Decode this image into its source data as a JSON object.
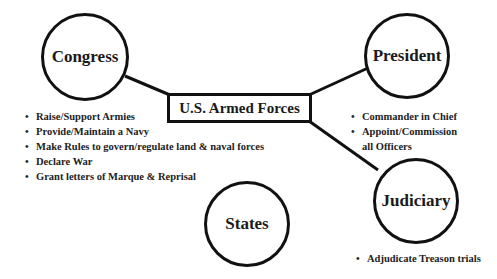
{
  "diagram": {
    "center": {
      "label": "U.S. Armed Forces"
    },
    "nodes": [
      {
        "id": "congress",
        "label": "Congress",
        "bullets": [
          "Raise/Support Armies",
          "Provide/Maintain a Navy",
          "Make Rules to govern/regulate land & naval forces",
          "Declare War",
          "Grant letters of Marque & Reprisal"
        ]
      },
      {
        "id": "president",
        "label": "President",
        "bullets": [
          "Commander in Chief",
          "Appoint/Commission all Officers"
        ]
      },
      {
        "id": "judiciary",
        "label": "Judiciary",
        "bullets": [
          "Adjudicate Treason trials"
        ]
      },
      {
        "id": "states",
        "label": "States",
        "bullets": []
      }
    ],
    "connections": [
      [
        "congress",
        "center"
      ],
      [
        "president",
        "center"
      ],
      [
        "judiciary",
        "center"
      ]
    ],
    "colors": {
      "stroke": "#111111",
      "text": "#1a1a1a",
      "background": "#ffffff"
    }
  }
}
